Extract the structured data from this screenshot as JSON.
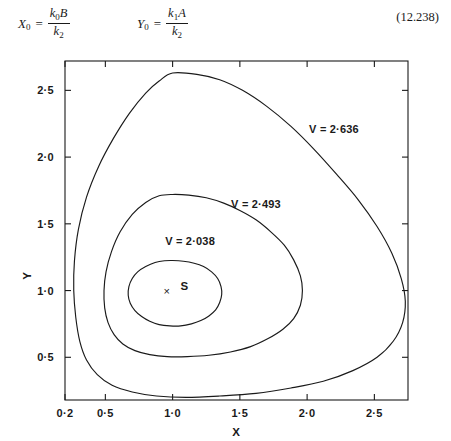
{
  "equation": {
    "x0_label": "X",
    "x0_sub": "0",
    "x0_num_k": "k",
    "x0_num_ksub": "0",
    "x0_num_var": "B",
    "x0_den_k": "k",
    "x0_den_ksub": "2",
    "y0_label": "Y",
    "y0_sub": "0",
    "y0_num_k": "k",
    "y0_num_ksub": "1",
    "y0_num_var": "A",
    "y0_den_k": "k",
    "y0_den_ksub": "2",
    "equals": "=",
    "number": "(12.238)"
  },
  "chart_data": {
    "type": "line",
    "title": "",
    "xlabel": "X",
    "ylabel": "Y",
    "xlim": [
      0.2,
      2.75
    ],
    "ylim": [
      0.18,
      2.72
    ],
    "grid": false,
    "legend": "none",
    "xticks": [
      0.2,
      0.5,
      1.0,
      1.5,
      2.0,
      2.5
    ],
    "xticklabels": [
      "0·2",
      "0·5",
      "1·0",
      "1·5",
      "2·0",
      "2·5"
    ],
    "yticks": [
      0.5,
      1.0,
      1.5,
      2.0,
      2.5
    ],
    "yticklabels": [
      "0·5",
      "1·0",
      "1·5",
      "2·0",
      "2·5"
    ],
    "series": [
      {
        "name": "V = 2·636",
        "label": "V = 2·636",
        "label_x": 2.2,
        "label_y": 2.18,
        "closed": true,
        "points": [
          [
            1.0,
            2.63
          ],
          [
            1.18,
            2.62
          ],
          [
            1.35,
            2.58
          ],
          [
            1.52,
            2.5
          ],
          [
            1.7,
            2.38
          ],
          [
            1.88,
            2.23
          ],
          [
            2.05,
            2.06
          ],
          [
            2.22,
            1.87
          ],
          [
            2.38,
            1.68
          ],
          [
            2.52,
            1.48
          ],
          [
            2.63,
            1.28
          ],
          [
            2.7,
            1.09
          ],
          [
            2.73,
            0.92
          ],
          [
            2.71,
            0.76
          ],
          [
            2.64,
            0.62
          ],
          [
            2.52,
            0.5
          ],
          [
            2.34,
            0.4
          ],
          [
            2.12,
            0.32
          ],
          [
            1.88,
            0.27
          ],
          [
            1.62,
            0.23
          ],
          [
            1.35,
            0.21
          ],
          [
            1.1,
            0.2
          ],
          [
            0.88,
            0.21
          ],
          [
            0.7,
            0.24
          ],
          [
            0.55,
            0.29
          ],
          [
            0.44,
            0.37
          ],
          [
            0.36,
            0.48
          ],
          [
            0.31,
            0.62
          ],
          [
            0.28,
            0.8
          ],
          [
            0.265,
            1.0
          ],
          [
            0.27,
            1.22
          ],
          [
            0.3,
            1.46
          ],
          [
            0.36,
            1.7
          ],
          [
            0.45,
            1.93
          ],
          [
            0.56,
            2.14
          ],
          [
            0.68,
            2.33
          ],
          [
            0.8,
            2.48
          ],
          [
            0.9,
            2.57
          ],
          [
            1.0,
            2.63
          ]
        ]
      },
      {
        "name": "V = 2·493",
        "label": "V = 2·493",
        "label_x": 1.62,
        "label_y": 1.62,
        "closed": true,
        "points": [
          [
            1.0,
            1.72
          ],
          [
            1.12,
            1.715
          ],
          [
            1.25,
            1.695
          ],
          [
            1.38,
            1.655
          ],
          [
            1.5,
            1.6
          ],
          [
            1.62,
            1.53
          ],
          [
            1.73,
            1.44
          ],
          [
            1.83,
            1.34
          ],
          [
            1.9,
            1.23
          ],
          [
            1.95,
            1.11
          ],
          [
            1.965,
            1.0
          ],
          [
            1.95,
            0.89
          ],
          [
            1.9,
            0.79
          ],
          [
            1.82,
            0.71
          ],
          [
            1.71,
            0.64
          ],
          [
            1.58,
            0.58
          ],
          [
            1.43,
            0.54
          ],
          [
            1.27,
            0.515
          ],
          [
            1.11,
            0.505
          ],
          [
            0.96,
            0.505
          ],
          [
            0.83,
            0.52
          ],
          [
            0.72,
            0.55
          ],
          [
            0.63,
            0.6
          ],
          [
            0.565,
            0.67
          ],
          [
            0.52,
            0.76
          ],
          [
            0.495,
            0.87
          ],
          [
            0.49,
            1.0
          ],
          [
            0.505,
            1.14
          ],
          [
            0.545,
            1.29
          ],
          [
            0.61,
            1.44
          ],
          [
            0.7,
            1.57
          ],
          [
            0.8,
            1.66
          ],
          [
            0.9,
            1.71
          ],
          [
            1.0,
            1.72
          ]
        ]
      },
      {
        "name": "V = 2·038",
        "label": "V = 2·038",
        "label_x": 1.13,
        "label_y": 1.345,
        "closed": true,
        "points": [
          [
            1.0,
            1.225
          ],
          [
            1.08,
            1.22
          ],
          [
            1.16,
            1.205
          ],
          [
            1.23,
            1.18
          ],
          [
            1.29,
            1.14
          ],
          [
            1.335,
            1.09
          ],
          [
            1.36,
            1.03
          ],
          [
            1.365,
            0.97
          ],
          [
            1.35,
            0.91
          ],
          [
            1.32,
            0.855
          ],
          [
            1.27,
            0.81
          ],
          [
            1.21,
            0.775
          ],
          [
            1.14,
            0.75
          ],
          [
            1.06,
            0.735
          ],
          [
            0.98,
            0.735
          ],
          [
            0.9,
            0.745
          ],
          [
            0.83,
            0.77
          ],
          [
            0.77,
            0.805
          ],
          [
            0.72,
            0.85
          ],
          [
            0.685,
            0.905
          ],
          [
            0.67,
            0.965
          ],
          [
            0.675,
            1.03
          ],
          [
            0.7,
            1.09
          ],
          [
            0.74,
            1.14
          ],
          [
            0.8,
            1.18
          ],
          [
            0.87,
            1.21
          ],
          [
            0.94,
            1.223
          ],
          [
            1.0,
            1.225
          ]
        ]
      }
    ],
    "annotations": [
      {
        "name": "steady-state-marker",
        "glyph": "×",
        "label": "S",
        "x": 1.0,
        "y": 1.0
      }
    ]
  }
}
